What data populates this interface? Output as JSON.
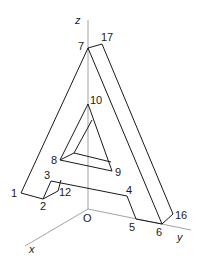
{
  "figure": {
    "axes": {
      "x_label": "x",
      "y_label": "y",
      "z_label": "z",
      "origin_label": "O"
    },
    "vertex_labels": {
      "v1": "1",
      "v2": "2",
      "v3": "3",
      "v4": "4",
      "v5": "5",
      "v6": "6",
      "v7": "7",
      "v8": "8",
      "v9": "9",
      "v10": "10",
      "v12": "12",
      "v16": "16",
      "v17": "17"
    },
    "colors": {
      "edge": "#1a1a1a",
      "axis": "#8a8a8a",
      "background": "#ffffff"
    }
  }
}
